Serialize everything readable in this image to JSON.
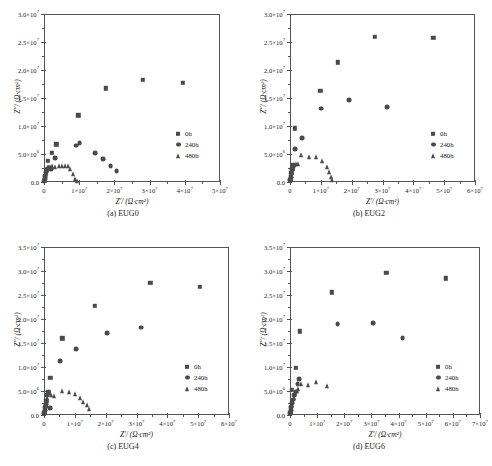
{
  "figure": {
    "axis_x_label": "Z′/ (Ω·cm²)",
    "axis_y_label": "Z″/ (Ω·cm²)",
    "legend_entries": [
      "0h",
      "240h",
      "480h"
    ],
    "marker_color": "#4a4a4a",
    "axis_color": "#555555",
    "background": "#ffffff"
  },
  "chart_data": [
    {
      "type": "scatter",
      "panel": "a",
      "title": "(a) EUG0",
      "xlabel": "Z′/ (Ω·cm²)",
      "ylabel": "Z″/ (Ω·cm²)",
      "xlim": [
        0,
        50000000
      ],
      "ylim": [
        0,
        30000000
      ],
      "xticks": [
        0,
        10000000,
        20000000,
        30000000,
        40000000,
        50000000
      ],
      "xtick_labels": [
        "0",
        "1×10⁷",
        "2×10⁷",
        "3×10⁷",
        "4×10⁷",
        "5×10⁷"
      ],
      "yticks": [
        0,
        5000000,
        10000000,
        15000000,
        20000000,
        25000000,
        30000000
      ],
      "ytick_labels": [
        "0.0",
        "5.0×10⁶",
        "1.0×10⁷",
        "1.5×10⁷",
        "2.0×10⁷",
        "2.5×10⁷",
        "3.0×10⁷"
      ],
      "grid": false,
      "legend_position": "bottom-right",
      "series": [
        {
          "name": "0h",
          "marker": "square",
          "points": [
            [
              150000,
              300000
            ],
            [
              300000,
              900000
            ],
            [
              500000,
              1500000
            ],
            [
              800000,
              2200000
            ],
            [
              1100000,
              3800000
            ],
            [
              2200000,
              5200000
            ],
            [
              3500000,
              6700000
            ],
            [
              9800000,
              11900000
            ],
            [
              17500000,
              16700000
            ],
            [
              28000000,
              18300000
            ],
            [
              39500000,
              17700000
            ]
          ]
        },
        {
          "name": "240h",
          "marker": "circle",
          "points": [
            [
              100000,
              200000
            ],
            [
              250000,
              600000
            ],
            [
              400000,
              1100000
            ],
            [
              700000,
              1700000
            ],
            [
              1000000,
              2300000
            ],
            [
              1500000,
              2500000
            ],
            [
              2100000,
              2300000
            ],
            [
              3100000,
              4300000
            ],
            [
              9200000,
              6500000
            ],
            [
              10100000,
              6900000
            ],
            [
              14500000,
              5200000
            ],
            [
              16800000,
              4100000
            ],
            [
              18900000,
              2900000
            ],
            [
              20600000,
              2000000
            ]
          ]
        },
        {
          "name": "480h",
          "marker": "triangle",
          "points": [
            [
              100000,
              400000
            ],
            [
              200000,
              900000
            ],
            [
              350000,
              1500000
            ],
            [
              500000,
              2000000
            ],
            [
              700000,
              2400000
            ],
            [
              1100000,
              2600000
            ],
            [
              1700000,
              2700000
            ],
            [
              2400000,
              2800000
            ],
            [
              3200000,
              2600000
            ],
            [
              4200000,
              2900000
            ],
            [
              5100000,
              2800000
            ],
            [
              5900000,
              2850000
            ],
            [
              6700000,
              2800000
            ],
            [
              7400000,
              2300000
            ],
            [
              8200000,
              1400000
            ],
            [
              8900000,
              600000
            ],
            [
              9400000,
              200000
            ]
          ]
        }
      ]
    },
    {
      "type": "scatter",
      "panel": "b",
      "title": "(b) EUG2",
      "xlabel": "Z′/ (Ω·cm²)",
      "ylabel": "Z″/ (Ω·cm²)",
      "xlim": [
        0,
        60000000
      ],
      "ylim": [
        0,
        30000000
      ],
      "xticks": [
        0,
        10000000,
        20000000,
        30000000,
        40000000,
        50000000,
        60000000
      ],
      "xtick_labels": [
        "0",
        "1×10⁷",
        "2×10⁷",
        "3×10⁷",
        "4×10⁷",
        "5×10⁷",
        "6×10⁷"
      ],
      "yticks": [
        0,
        5000000,
        10000000,
        15000000,
        20000000,
        25000000,
        30000000
      ],
      "ytick_labels": [
        "0.0",
        "5.0×10⁶",
        "1.0×10⁷",
        "1.5×10⁷",
        "2.0×10⁷",
        "2.5×10⁷",
        "3.0×10⁷"
      ],
      "grid": false,
      "legend_position": "bottom-right",
      "series": [
        {
          "name": "0h",
          "marker": "square",
          "points": [
            [
              150000,
              400000
            ],
            [
              300000,
              900000
            ],
            [
              450000,
              1600000
            ],
            [
              700000,
              2400000
            ],
            [
              1000000,
              3100000
            ],
            [
              1600000,
              9600000
            ],
            [
              9800000,
              16300000
            ],
            [
              15500000,
              21400000
            ],
            [
              27500000,
              25900000
            ],
            [
              46500000,
              25700000
            ]
          ]
        },
        {
          "name": "240h",
          "marker": "circle",
          "points": [
            [
              120000,
              300000
            ],
            [
              280000,
              800000
            ],
            [
              500000,
              1500000
            ],
            [
              800000,
              2200000
            ],
            [
              1200000,
              2900000
            ],
            [
              1700000,
              5900000
            ],
            [
              3900000,
              7900000
            ],
            [
              10200000,
              13100000
            ],
            [
              19200000,
              14600000
            ],
            [
              31500000,
              13400000
            ]
          ]
        },
        {
          "name": "480h",
          "marker": "triangle",
          "points": [
            [
              150000,
              400000
            ],
            [
              300000,
              1000000
            ],
            [
              450000,
              1700000
            ],
            [
              700000,
              2300000
            ],
            [
              900000,
              2700000
            ],
            [
              1300000,
              3000000
            ],
            [
              1900000,
              3300000
            ],
            [
              2600000,
              3300000
            ],
            [
              3500000,
              4800000
            ],
            [
              6200000,
              4400000
            ],
            [
              8300000,
              4400000
            ],
            [
              10500000,
              3700000
            ],
            [
              11900000,
              2600000
            ],
            [
              12600000,
              1800000
            ],
            [
              13200000,
              900000
            ],
            [
              13700000,
              300000
            ]
          ]
        }
      ]
    },
    {
      "type": "scatter",
      "panel": "c",
      "title": "(c) EUG4",
      "xlabel": "Z′/ (Ω·cm²)",
      "ylabel": "Z″/ (Ω·cm²)",
      "xlim": [
        0,
        60000000
      ],
      "ylim": [
        0,
        35000000
      ],
      "xticks": [
        0,
        10000000,
        20000000,
        30000000,
        40000000,
        50000000,
        60000000
      ],
      "xtick_labels": [
        "0",
        "1×10⁷",
        "2×10⁷",
        "3×10⁷",
        "4×10⁷",
        "5×10⁷",
        "6×10⁷"
      ],
      "yticks": [
        0,
        5000000,
        10000000,
        15000000,
        20000000,
        25000000,
        30000000,
        35000000
      ],
      "ytick_labels": [
        "0.0",
        "5.0×10⁶",
        "1.0×10⁷",
        "1.5×10⁷",
        "2.0×10⁷",
        "2.5×10⁷",
        "3.0×10⁷",
        "3.5×10⁷"
      ],
      "grid": false,
      "legend_position": "bottom-right",
      "series": [
        {
          "name": "0h",
          "marker": "square",
          "points": [
            [
              150000,
              400000
            ],
            [
              300000,
              1100000
            ],
            [
              500000,
              2000000
            ],
            [
              800000,
              2900000
            ],
            [
              1400000,
              4700000
            ],
            [
              2100000,
              7800000
            ],
            [
              5900000,
              16000000
            ],
            [
              16500000,
              22700000
            ],
            [
              34500000,
              27600000
            ],
            [
              50500000,
              26700000
            ]
          ]
        },
        {
          "name": "240h",
          "marker": "circle",
          "points": [
            [
              120000,
              300000
            ],
            [
              280000,
              900000
            ],
            [
              450000,
              1600000
            ],
            [
              700000,
              2200000
            ],
            [
              1000000,
              4200000
            ],
            [
              1900000,
              1500000
            ],
            [
              5200000,
              11300000
            ],
            [
              10500000,
              13700000
            ],
            [
              20500000,
              17100000
            ],
            [
              31500000,
              18200000
            ]
          ]
        },
        {
          "name": "480h",
          "marker": "triangle",
          "points": [
            [
              150000,
              500000
            ],
            [
              300000,
              1200000
            ],
            [
              500000,
              2100000
            ],
            [
              750000,
              2900000
            ],
            [
              1100000,
              3500000
            ],
            [
              1700000,
              4700000
            ],
            [
              2400000,
              4200000
            ],
            [
              3300000,
              4000000
            ],
            [
              5800000,
              5100000
            ],
            [
              8200000,
              4700000
            ],
            [
              10200000,
              4400000
            ],
            [
              11800000,
              3500000
            ],
            [
              12800000,
              2800000
            ],
            [
              13800000,
              2000000
            ],
            [
              14500000,
              1200000
            ]
          ]
        }
      ]
    },
    {
      "type": "scatter",
      "panel": "d",
      "title": "(d) EUG6",
      "xlabel": "Z′/ (Ω·cm²)",
      "ylabel": "Z″/ (Ω·cm²)",
      "xlim": [
        0,
        70000000
      ],
      "ylim": [
        0,
        35000000
      ],
      "xticks": [
        0,
        10000000,
        20000000,
        30000000,
        40000000,
        50000000,
        60000000,
        70000000
      ],
      "xtick_labels": [
        "0",
        "1×10⁷",
        "2×10⁷",
        "3×10⁷",
        "4×10⁷",
        "5×10⁷",
        "6×10⁷",
        "7×10⁷"
      ],
      "yticks": [
        0,
        5000000,
        10000000,
        15000000,
        20000000,
        25000000,
        30000000,
        35000000
      ],
      "ytick_labels": [
        "0.0",
        "5.0×10⁶",
        "1.0×10⁷",
        "1.5×10⁷",
        "2.0×10⁷",
        "2.5×10⁷",
        "3.0×10⁷",
        "3.5×10⁷"
      ],
      "grid": false,
      "legend_position": "bottom-right",
      "series": [
        {
          "name": "0h",
          "marker": "square",
          "points": [
            [
              150000,
              500000
            ],
            [
              350000,
              1100000
            ],
            [
              600000,
              5300000
            ],
            [
              2100000,
              9800000
            ],
            [
              3600000,
              17400000
            ],
            [
              15500000,
              25600000
            ],
            [
              35500000,
              29600000
            ],
            [
              57500000,
              28500000
            ]
          ]
        },
        {
          "name": "240h",
          "marker": "circle",
          "points": [
            [
              120000,
              400000
            ],
            [
              300000,
              900000
            ],
            [
              500000,
              1700000
            ],
            [
              800000,
              2500000
            ],
            [
              1100000,
              3200000
            ],
            [
              1600000,
              4100000
            ],
            [
              2100000,
              4800000
            ],
            [
              2800000,
              6400000
            ],
            [
              3400000,
              7500000
            ],
            [
              17500000,
              19000000
            ],
            [
              30500000,
              19200000
            ],
            [
              41500000,
              16000000
            ]
          ]
        },
        {
          "name": "480h",
          "marker": "triangle",
          "points": [
            [
              150000,
              600000
            ],
            [
              350000,
              1300000
            ],
            [
              600000,
              2100000
            ],
            [
              900000,
              2900000
            ],
            [
              1300000,
              3600000
            ],
            [
              1800000,
              4300000
            ],
            [
              2400000,
              5000000
            ],
            [
              3100000,
              5400000
            ],
            [
              4100000,
              6400000
            ],
            [
              6500000,
              6200000
            ],
            [
              9500000,
              6900000
            ],
            [
              13500000,
              6000000
            ]
          ]
        }
      ]
    }
  ]
}
